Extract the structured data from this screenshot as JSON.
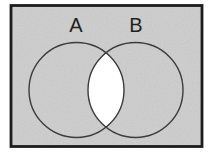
{
  "figure": {
    "type": "venn-diagram",
    "set_a_label": "A",
    "set_b_label": "B",
    "regions": {
      "shaded": "universal set, set A only, set B only",
      "unshaded": "intersection of A and B"
    },
    "colors": {
      "background": "#ffffff",
      "shaded_fill": "#d2d2d2",
      "unshaded_fill": "#ffffff",
      "frame_border": "#1c1c1c",
      "circle_outline": "#3c3c3c",
      "label_text": "#1f1f1f"
    }
  }
}
